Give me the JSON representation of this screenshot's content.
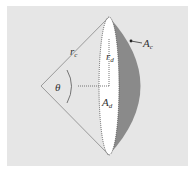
{
  "figure": {
    "type": "geometry-diagram",
    "colors": {
      "background_panel": "#e6e6e6",
      "outer_border": "#ffffff",
      "cone_lines": "#9a9a9a",
      "disk_fill": "#ffffff",
      "cap_fill": "#8a8a8a",
      "dotted_lines": "#777777",
      "text": "#333333"
    },
    "labels": {
      "cone_radius": {
        "main": "r",
        "sub": "c"
      },
      "disk_radius": {
        "main": "r",
        "sub": "d"
      },
      "angle": {
        "main": "θ"
      },
      "disk_area": {
        "main": "A",
        "sub": "d"
      },
      "cap_area": {
        "main": "A",
        "sub": "c"
      }
    }
  }
}
